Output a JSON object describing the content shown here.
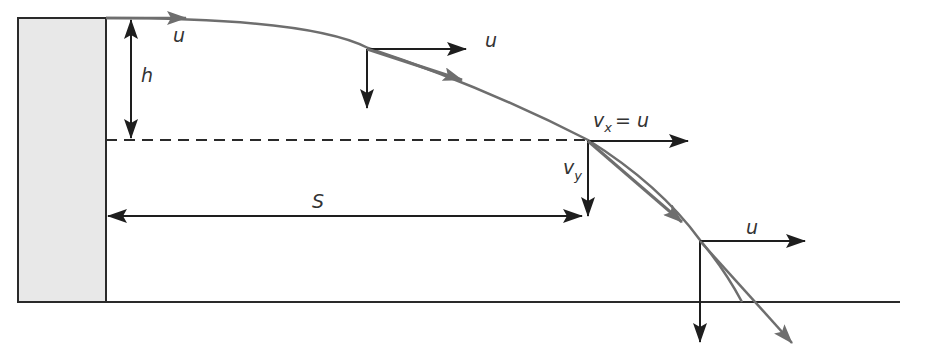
{
  "diagram": {
    "labels": {
      "initial_velocity": "u",
      "height": "h",
      "velocity_top_mid": "u",
      "vx_main": "v",
      "vx_sub": "x",
      "vx_eq": "= u",
      "vy_main": "v",
      "vy_sub": "y",
      "range": "S",
      "velocity_ground": "u"
    },
    "colors": {
      "cliff_fill": "#e8e8e8",
      "line": "#2a2a2a",
      "trajectory": "#6e6e6e",
      "background": "#ffffff"
    }
  }
}
